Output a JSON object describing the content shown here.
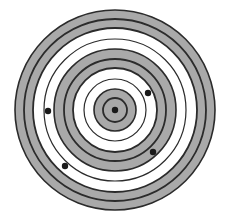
{
  "diagram": {
    "type": "concentric-target",
    "center": {
      "x": 115,
      "y": 110
    },
    "colors": {
      "background": "#ffffff",
      "band_fill": "#a9a9a9",
      "white_fill": "#ffffff",
      "line": "#2b2b2b",
      "dot": "#1a1a1a"
    },
    "bands": [
      {
        "outer": 100,
        "inner": 82,
        "fill": "gray"
      },
      {
        "outer": 82,
        "inner": 61,
        "fill": "white"
      },
      {
        "outer": 61,
        "inner": 42,
        "fill": "gray"
      },
      {
        "outer": 42,
        "inner": 21,
        "fill": "white"
      },
      {
        "outer": 21,
        "inner": 0,
        "fill": "gray"
      }
    ],
    "circle_lines": [
      {
        "r": 100,
        "width": 1.6
      },
      {
        "r": 91,
        "width": 1.8
      },
      {
        "r": 82,
        "width": 1.8
      },
      {
        "r": 71,
        "width": 1.2
      },
      {
        "r": 61,
        "width": 1.6
      },
      {
        "r": 51,
        "width": 1.8
      },
      {
        "r": 42,
        "width": 1.8
      },
      {
        "r": 31,
        "width": 1.2
      },
      {
        "r": 21,
        "width": 1.6
      },
      {
        "r": 12,
        "width": 1.8
      }
    ],
    "dots": [
      {
        "x": 115,
        "y": 110,
        "r": 3.2
      },
      {
        "x": 148,
        "y": 93,
        "r": 3.2
      },
      {
        "x": 153,
        "y": 152,
        "r": 3.2
      },
      {
        "x": 65,
        "y": 166,
        "r": 3.2
      },
      {
        "x": 48,
        "y": 111,
        "r": 3.2
      }
    ]
  }
}
